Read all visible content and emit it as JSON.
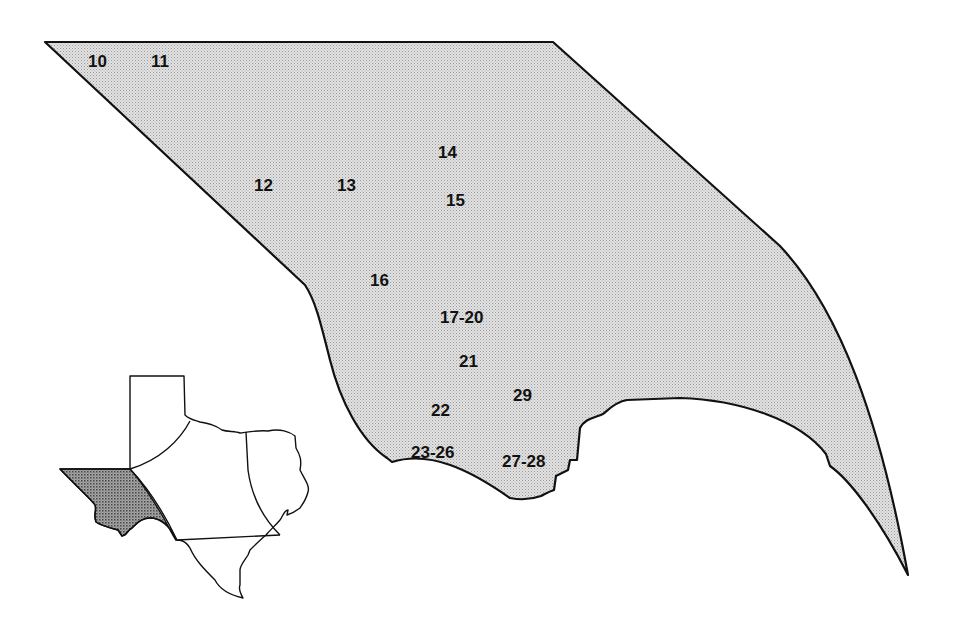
{
  "map": {
    "region_fill": "#d4d4d4",
    "inset_highlight_fill": "#8a8a8a",
    "outline_color": "#111111",
    "site_labels": [
      {
        "text": "10",
        "x": 88,
        "y": 53
      },
      {
        "text": "11",
        "x": 151,
        "y": 53
      },
      {
        "text": "12",
        "x": 254,
        "y": 177
      },
      {
        "text": "13",
        "x": 337,
        "y": 177
      },
      {
        "text": "14",
        "x": 438,
        "y": 144
      },
      {
        "text": "15",
        "x": 446,
        "y": 192
      },
      {
        "text": "16",
        "x": 370,
        "y": 272
      },
      {
        "text": "17-20",
        "x": 440,
        "y": 309
      },
      {
        "text": "21",
        "x": 459,
        "y": 353
      },
      {
        "text": "22",
        "x": 431,
        "y": 402
      },
      {
        "text": "23-26",
        "x": 411,
        "y": 444
      },
      {
        "text": "27-28",
        "x": 502,
        "y": 453
      },
      {
        "text": "29",
        "x": 513,
        "y": 387
      }
    ]
  },
  "inset": {
    "name": "Texas locator map",
    "highlighted_region": "Trans-Pecos (West Texas)"
  }
}
